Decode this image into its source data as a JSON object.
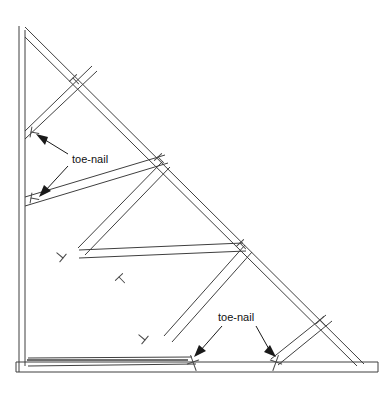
{
  "diagram": {
    "type": "line-drawing",
    "background_color": "#ffffff",
    "line_color": "#3f3f3f",
    "text_color": "#111111",
    "callouts": [
      {
        "id": "callout-upper",
        "label": "toe-nail",
        "text_x": 72,
        "text_y": 159,
        "arrows": [
          {
            "from_x": 68,
            "from_y": 154,
            "to_x": 37,
            "to_y": 135
          },
          {
            "from_x": 68,
            "from_y": 166,
            "to_x": 41,
            "to_y": 196
          }
        ]
      },
      {
        "id": "callout-lower",
        "label": "toe-nail",
        "text_x": 218,
        "text_y": 318,
        "arrows": [
          {
            "from_x": 222,
            "from_y": 326,
            "to_x": 196,
            "to_y": 356
          },
          {
            "from_x": 256,
            "from_y": 326,
            "to_x": 272,
            "to_y": 356
          }
        ]
      }
    ],
    "members": [
      {
        "name": "left-vertical-post",
        "x1": 22,
        "y1": 28,
        "x2": 22,
        "y2": 366,
        "thickness": 6
      },
      {
        "name": "top-chord-rafter",
        "x1": 25,
        "y1": 30,
        "x2": 361,
        "y2": 364,
        "thickness": 7
      },
      {
        "name": "bottom-chord",
        "x1": 16,
        "y1": 368,
        "x2": 378,
        "y2": 368,
        "thickness": 7
      },
      {
        "name": "web-upper-left-diagonal",
        "x1": 26,
        "y1": 135,
        "x2": 90,
        "y2": 72,
        "thickness": 5
      },
      {
        "name": "web-left-lower-diagonal",
        "x1": 26,
        "y1": 196,
        "x2": 160,
        "y2": 160,
        "thickness": 5
      },
      {
        "name": "web-center-left-diagonal",
        "x1": 82,
        "y1": 252,
        "x2": 166,
        "y2": 160,
        "thickness": 5
      },
      {
        "name": "web-center-horizontal",
        "x1": 82,
        "y1": 252,
        "x2": 246,
        "y2": 248,
        "thickness": 5
      },
      {
        "name": "web-center-right-diagonal",
        "x1": 168,
        "y1": 338,
        "x2": 248,
        "y2": 248,
        "thickness": 5
      },
      {
        "name": "web-bottom-left-diagonal",
        "x1": 28,
        "y1": 362,
        "x2": 190,
        "y2": 362,
        "thickness": 5
      },
      {
        "name": "web-right-diagonal",
        "x1": 272,
        "y1": 362,
        "x2": 322,
        "y2": 320,
        "thickness": 5
      }
    ],
    "nails": [
      {
        "name": "nail-rafter-upper",
        "x": 73,
        "y": 78,
        "angle": -46
      },
      {
        "name": "nail-post-upper",
        "x": 33,
        "y": 133,
        "angle": -46
      },
      {
        "name": "nail-rafter-mid-upper",
        "x": 158,
        "y": 159,
        "angle": -46
      },
      {
        "name": "nail-post-lower",
        "x": 33,
        "y": 198,
        "angle": -46
      },
      {
        "name": "nail-web-left",
        "x": 64,
        "y": 258,
        "angle": 134
      },
      {
        "name": "nail-web-center",
        "x": 119,
        "y": 279,
        "angle": -46
      },
      {
        "name": "nail-rafter-right",
        "x": 240,
        "y": 245,
        "angle": -46
      },
      {
        "name": "nail-web-lower-center",
        "x": 145,
        "y": 341,
        "angle": 134
      },
      {
        "name": "nail-bottom-left",
        "x": 193,
        "y": 360,
        "angle": -60
      },
      {
        "name": "nail-bottom-right",
        "x": 276,
        "y": 360,
        "angle": -110
      },
      {
        "name": "nail-rafter-lower-right",
        "x": 320,
        "y": 322,
        "angle": -46
      }
    ]
  }
}
